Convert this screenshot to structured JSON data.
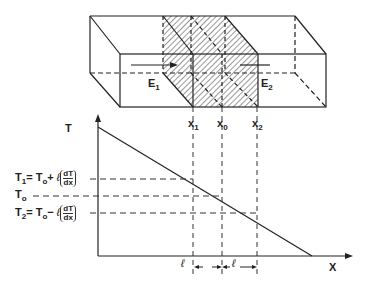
{
  "diagram": {
    "type": "thermal-gradient-bar-diagram",
    "bar": {
      "arrow_left_label": "E",
      "arrow_left_sub": "1",
      "arrow_right_label": "E",
      "arrow_right_sub": "2",
      "hatched_region": "slab between x1 and x2"
    },
    "markers": [
      {
        "name": "x",
        "sub": "1"
      },
      {
        "name": "x",
        "sub": "0"
      },
      {
        "name": "x",
        "sub": "2"
      }
    ],
    "graph": {
      "y_axis_label": "T",
      "x_axis_label": "X",
      "levels": [
        {
          "lhs": "T",
          "lhs_sub": "1",
          "rhs": "= T",
          "rhs_sub": "o",
          "op": "+",
          "ell": "ℓ",
          "num": "dT",
          "den": "dx"
        },
        {
          "lhs": "T",
          "lhs_sub": "o"
        },
        {
          "lhs": "T",
          "lhs_sub": "2",
          "rhs": "= T",
          "rhs_sub": "o",
          "op": "−",
          "ell": "ℓ",
          "num": "dT",
          "den": "dx"
        }
      ],
      "interval_labels": [
        "ℓ",
        "ℓ"
      ]
    }
  }
}
